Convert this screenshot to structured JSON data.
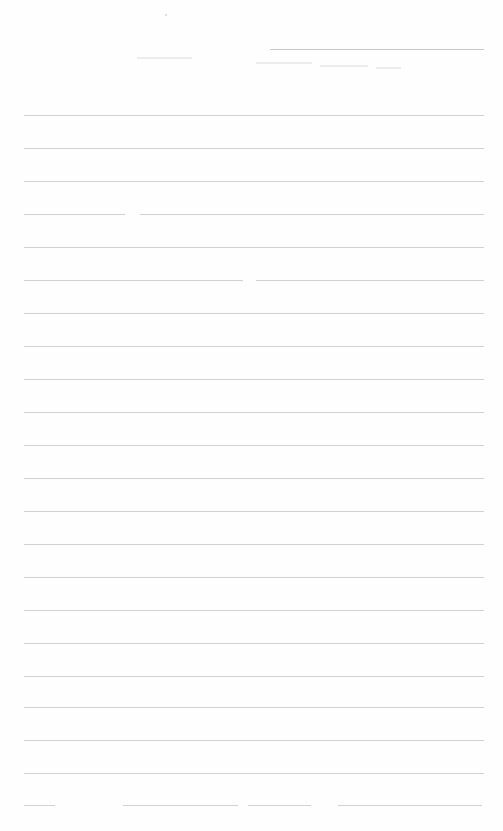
{
  "document": {
    "type": "lined-sheet",
    "header": {
      "title_line": {
        "x1": 270,
        "x2": 484,
        "y": 49
      },
      "faint_marks": [
        {
          "x1": 137,
          "x2": 192,
          "y": 57
        },
        {
          "x1": 256,
          "x2": 312,
          "y": 62
        },
        {
          "x1": 320,
          "x2": 368,
          "y": 65
        },
        {
          "x1": 376,
          "x2": 401,
          "y": 67
        }
      ],
      "dot": {
        "x": 165,
        "y": 14
      }
    },
    "rule_color": "#c9c9c9",
    "background_color": "#ffffff",
    "rules": [
      {
        "y": 115,
        "segments": [
          [
            24,
            484
          ]
        ]
      },
      {
        "y": 148,
        "segments": [
          [
            24,
            484
          ]
        ]
      },
      {
        "y": 181,
        "segments": [
          [
            24,
            484
          ]
        ]
      },
      {
        "y": 214,
        "segments": [
          [
            24,
            125
          ],
          [
            140,
            484
          ]
        ]
      },
      {
        "y": 247,
        "segments": [
          [
            24,
            484
          ]
        ]
      },
      {
        "y": 280,
        "segments": [
          [
            24,
            243
          ],
          [
            256,
            484
          ]
        ]
      },
      {
        "y": 313,
        "segments": [
          [
            24,
            484
          ]
        ]
      },
      {
        "y": 346,
        "segments": [
          [
            24,
            484
          ]
        ]
      },
      {
        "y": 379,
        "segments": [
          [
            24,
            484
          ]
        ]
      },
      {
        "y": 412,
        "segments": [
          [
            24,
            484
          ]
        ]
      },
      {
        "y": 445,
        "segments": [
          [
            24,
            484
          ]
        ]
      },
      {
        "y": 478,
        "segments": [
          [
            24,
            484
          ]
        ]
      },
      {
        "y": 511,
        "segments": [
          [
            24,
            484
          ]
        ]
      },
      {
        "y": 544,
        "segments": [
          [
            24,
            484
          ]
        ]
      },
      {
        "y": 577,
        "segments": [
          [
            24,
            484
          ]
        ]
      },
      {
        "y": 610,
        "segments": [
          [
            24,
            484
          ]
        ]
      },
      {
        "y": 643,
        "segments": [
          [
            24,
            484
          ]
        ]
      },
      {
        "y": 676,
        "segments": [
          [
            24,
            484
          ]
        ]
      },
      {
        "y": 707,
        "segments": [
          [
            24,
            484
          ]
        ]
      },
      {
        "y": 740,
        "segments": [
          [
            24,
            484
          ]
        ]
      },
      {
        "y": 773,
        "segments": [
          [
            24,
            484
          ]
        ]
      },
      {
        "y": 805,
        "segments": [
          [
            24,
            55
          ],
          [
            123,
            238
          ],
          [
            248,
            311
          ],
          [
            338,
            482
          ]
        ]
      }
    ],
    "footer_fields_count": 4
  }
}
